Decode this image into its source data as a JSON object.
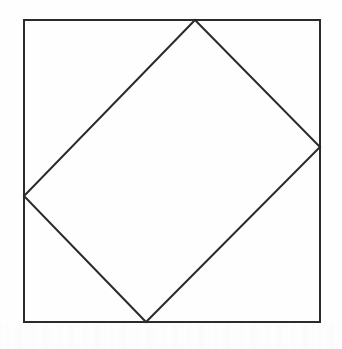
{
  "figure": {
    "background_color": "#fefefe",
    "stroke_color": "#2b2b2b",
    "stroke_width": 2,
    "canvas": {
      "width": 342,
      "height": 349
    }
  },
  "chart_data": {
    "type": "diagram",
    "xlabel": "",
    "ylabel": "",
    "xlim": [
      0,
      342
    ],
    "ylim": [
      0,
      349
    ],
    "grid": false,
    "legend": "none",
    "shapes": [
      {
        "name": "outer-square",
        "kind": "polygon",
        "closed": true,
        "fill": "none",
        "stroke": "#2b2b2b",
        "stroke_width": 2,
        "points": [
          [
            24,
            20
          ],
          [
            320,
            20
          ],
          [
            320,
            322
          ],
          [
            24,
            322
          ]
        ],
        "labels": [
          "top-left",
          "top-right",
          "bottom-right",
          "bottom-left"
        ],
        "width": 296,
        "height": 302
      },
      {
        "name": "inscribed-square",
        "kind": "polygon",
        "closed": true,
        "fill": "none",
        "stroke": "#2b2b2b",
        "stroke_width": 2,
        "points": [
          [
            195,
            20
          ],
          [
            320,
            147
          ],
          [
            146,
            322
          ],
          [
            24,
            196
          ]
        ],
        "labels": [
          "top-vertex-on-top-edge",
          "right-vertex-on-right-edge",
          "bottom-vertex-on-bottom-edge",
          "left-vertex-on-left-edge"
        ],
        "side_lengths": [
          178,
          246,
          215,
          250
        ]
      }
    ],
    "vertices": [
      {
        "name": "outer-top-left",
        "x": 24,
        "y": 20
      },
      {
        "name": "outer-top-right",
        "x": 320,
        "y": 20
      },
      {
        "name": "outer-bottom-right",
        "x": 320,
        "y": 322
      },
      {
        "name": "outer-bottom-left",
        "x": 24,
        "y": 322
      },
      {
        "name": "inner-top",
        "x": 195,
        "y": 20
      },
      {
        "name": "inner-right",
        "x": 320,
        "y": 147
      },
      {
        "name": "inner-bottom",
        "x": 146,
        "y": 322
      },
      {
        "name": "inner-left",
        "x": 24,
        "y": 196
      }
    ],
    "annotations": []
  }
}
